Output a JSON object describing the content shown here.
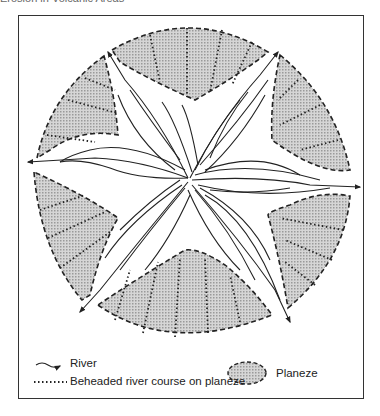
{
  "title": "Erosion in Volcanic Areas",
  "legend": {
    "river": "River",
    "beheaded": "Beheaded river course on planeze",
    "planeze": "Planeze"
  },
  "colors": {
    "planeze_fill": "#c8c8c8",
    "line": "#222222",
    "frame": "#333333"
  }
}
